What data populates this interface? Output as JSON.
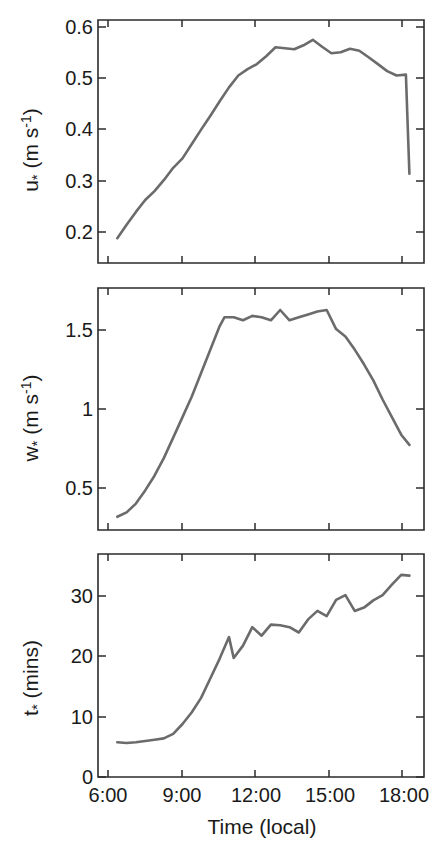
{
  "figure": {
    "panel_count": 3,
    "line_color": "#6b6b6b",
    "axis_color": "#2b2b2b",
    "background": "#ffffff"
  },
  "xaxis": {
    "label": "Time (local)",
    "tick_labels": [
      "6:00",
      "9:00",
      "12:00",
      "15:00",
      "18:00"
    ],
    "tick_values": [
      6,
      9,
      12,
      15,
      18
    ],
    "range": [
      5.6,
      18.9
    ]
  },
  "panels": {
    "top": {
      "ylabel_main": "u",
      "ylabel_star": "*",
      "ylabel_unit_open": " (m s",
      "ylabel_unit_sup": "-1",
      "ylabel_unit_close": ")",
      "ylabel_full": "u* (m s-1)",
      "tick_labels": [
        "0.2",
        "0.3",
        "0.4",
        "0.5",
        "0.6"
      ],
      "tick_values": [
        0.2,
        0.3,
        0.4,
        0.5,
        0.6
      ]
    },
    "middle": {
      "ylabel_main": "w",
      "ylabel_star": "*",
      "ylabel_unit_open": " (m s",
      "ylabel_unit_sup": "-1",
      "ylabel_unit_close": ")",
      "ylabel_full": "w* (m s-1)",
      "tick_labels": [
        "0.5",
        "1",
        "1.5"
      ],
      "tick_values": [
        0.5,
        1,
        1.5
      ]
    },
    "bottom": {
      "ylabel_main": "t",
      "ylabel_star": "*",
      "ylabel_unit_open": " (mins)",
      "ylabel_unit_sup": "",
      "ylabel_unit_close": "",
      "ylabel_full": "t* (mins)",
      "tick_labels": [
        "0",
        "10",
        "20",
        "30"
      ],
      "tick_values": [
        0,
        10,
        20,
        30
      ]
    }
  },
  "chart_data": [
    {
      "type": "line",
      "panel": "top",
      "title": "",
      "xlabel": "",
      "ylabel": "u* (m s-1)",
      "xlim": [
        5.6,
        18.9
      ],
      "ylim": [
        0.155,
        0.645
      ],
      "grid": false,
      "legend": "none",
      "xtick_labels": [
        "6:00",
        "9:00",
        "12:00",
        "15:00",
        "18:00"
      ],
      "ytick_labels": [
        "0.2",
        "0.3",
        "0.4",
        "0.5",
        "0.6"
      ],
      "x": [
        6.0,
        6.4,
        6.8,
        7.2,
        7.6,
        8.0,
        8.4,
        8.8,
        9.2,
        9.6,
        10.0,
        10.4,
        10.8,
        11.2,
        11.6,
        12.0,
        12.4,
        12.8,
        13.2,
        13.6,
        14.0,
        14.4,
        14.8,
        15.2,
        15.6,
        16.0,
        16.4,
        16.8,
        17.2,
        17.6,
        18.0,
        18.4
      ],
      "y": [
        0.205,
        0.232,
        0.258,
        0.282,
        0.3,
        0.322,
        0.347,
        0.366,
        0.395,
        0.424,
        0.452,
        0.481,
        0.509,
        0.533,
        0.546,
        0.556,
        0.572,
        0.59,
        0.588,
        0.586,
        0.594,
        0.605,
        0.591,
        0.578,
        0.58,
        0.587,
        0.583,
        0.57,
        0.556,
        0.542,
        0.533,
        0.535
      ]
    },
    {
      "type": "line",
      "panel": "top-continued",
      "x": [
        18.4,
        18.55
      ],
      "y": [
        0.535,
        0.335
      ],
      "note": "late-afternoon decline continues to 0.335 at 18:30"
    },
    {
      "type": "line",
      "panel": "middle",
      "title": "",
      "xlabel": "",
      "ylabel": "w* (m s-1)",
      "xlim": [
        5.6,
        18.9
      ],
      "ylim": [
        0.13,
        1.78
      ],
      "grid": false,
      "legend": "none",
      "xtick_labels": [
        "6:00",
        "9:00",
        "12:00",
        "15:00",
        "18:00"
      ],
      "ytick_labels": [
        "0.5",
        "1",
        "1.5"
      ],
      "x": [
        6.0,
        6.4,
        6.8,
        7.2,
        7.6,
        8.0,
        8.4,
        8.8,
        9.2,
        9.6,
        10.0,
        10.4,
        10.6,
        11.0,
        11.4,
        11.8,
        12.2,
        12.6,
        13.0,
        13.4,
        13.8,
        14.2,
        14.6,
        15.0,
        15.4,
        15.8,
        16.2,
        16.6,
        17.0,
        17.4,
        17.8,
        18.2,
        18.55
      ],
      "y": [
        0.22,
        0.25,
        0.31,
        0.4,
        0.5,
        0.62,
        0.76,
        0.9,
        1.04,
        1.2,
        1.36,
        1.52,
        1.58,
        1.58,
        1.56,
        1.59,
        1.58,
        1.56,
        1.63,
        1.56,
        1.58,
        1.6,
        1.62,
        1.63,
        1.5,
        1.45,
        1.36,
        1.26,
        1.15,
        1.02,
        0.9,
        0.78,
        0.71
      ]
    },
    {
      "type": "line",
      "panel": "bottom",
      "title": "",
      "xlabel": "Time (local)",
      "ylabel": "t* (mins)",
      "xlim": [
        5.6,
        18.9
      ],
      "ylim": [
        -0.6,
        33.5
      ],
      "grid": false,
      "legend": "none",
      "xtick_labels": [
        "6:00",
        "9:00",
        "12:00",
        "15:00",
        "18:00"
      ],
      "ytick_labels": [
        "0",
        "10",
        "20",
        "30"
      ],
      "x": [
        6.0,
        6.4,
        6.8,
        7.2,
        7.6,
        8.0,
        8.4,
        8.8,
        9.2,
        9.6,
        10.0,
        10.4,
        10.8,
        11.0,
        11.4,
        11.8,
        12.2,
        12.6,
        13.0,
        13.4,
        13.8,
        14.2,
        14.6,
        15.0,
        15.4,
        15.8,
        16.2,
        16.6,
        17.0,
        17.4,
        17.8,
        18.2,
        18.55
      ],
      "y": [
        4.7,
        4.6,
        4.7,
        4.9,
        5.1,
        5.3,
        6.0,
        7.5,
        9.3,
        11.5,
        14.5,
        17.5,
        20.8,
        17.6,
        19.5,
        22.3,
        21.0,
        22.7,
        22.6,
        22.3,
        21.5,
        23.5,
        24.8,
        24.0,
        26.5,
        27.2,
        24.8,
        25.3,
        26.4,
        27.2,
        28.8,
        30.3,
        30.2
      ]
    }
  ]
}
